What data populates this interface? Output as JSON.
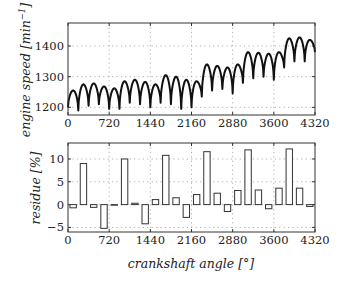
{
  "chart_data": [
    {
      "type": "line",
      "title": "",
      "xlabel": "",
      "ylabel": "engine speed [min^-1]",
      "xlim": [
        0,
        4320
      ],
      "ylim": [
        1175,
        1475
      ],
      "xticks": [
        0,
        720,
        1440,
        2160,
        2880,
        3600,
        4320
      ],
      "yticks": [
        1200,
        1300,
        1400
      ],
      "grid": true,
      "series": [
        {
          "name": "engine speed",
          "period_deg": 180,
          "troughs": [
            1200,
            1190,
            1205,
            1210,
            1195,
            1195,
            1215,
            1210,
            1200,
            1215,
            1210,
            1195,
            1200,
            1235,
            1255,
            1260,
            1245,
            1280,
            1295,
            1300,
            1290,
            1330,
            1350,
            1350,
            1380
          ],
          "peaks": [
            1255,
            1275,
            1278,
            1268,
            1262,
            1285,
            1290,
            1283,
            1275,
            1305,
            1300,
            1290,
            1285,
            1340,
            1335,
            1330,
            1340,
            1380,
            1378,
            1375,
            1380,
            1425,
            1428,
            1420
          ]
        }
      ]
    },
    {
      "type": "bar",
      "title": "",
      "xlabel": "crankshaft angle [°]",
      "ylabel": "residue [%]",
      "xlim": [
        0,
        4320
      ],
      "ylim": [
        -6,
        13.5
      ],
      "xticks": [
        0,
        720,
        1440,
        2160,
        2880,
        3600,
        4320
      ],
      "yticks": [
        -5,
        0,
        5,
        10
      ],
      "grid": true,
      "categories": [
        90,
        270,
        450,
        630,
        810,
        990,
        1170,
        1350,
        1530,
        1710,
        1890,
        2070,
        2250,
        2430,
        2610,
        2790,
        2970,
        3150,
        3330,
        3510,
        3690,
        3870,
        4050,
        4230
      ],
      "values": [
        -0.7,
        9.0,
        -0.6,
        -5.2,
        0.0,
        10.0,
        0.3,
        -4.2,
        1.1,
        10.8,
        1.5,
        -2.8,
        2.2,
        11.6,
        2.5,
        -1.5,
        3.1,
        12.0,
        3.2,
        -0.9,
        3.6,
        12.2,
        3.6,
        -0.4
      ]
    }
  ],
  "labels": {
    "top_ylabel_main": "engine speed [min",
    "top_ylabel_exp": "−1",
    "top_ylabel_close": "]",
    "bottom_ylabel": "residue [%]",
    "xlabel": "crankshaft angle [°]"
  }
}
